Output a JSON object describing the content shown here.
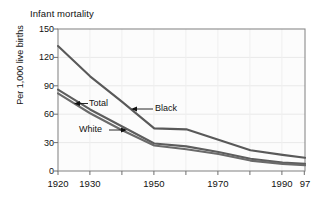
{
  "chart_data": {
    "type": "line",
    "title": "Infant mortality",
    "xlabel": "",
    "ylabel": "Per 1,000 live births",
    "xlim": [
      1920,
      1997
    ],
    "ylim": [
      0,
      150
    ],
    "grid": true,
    "legend_position": "inline-annotations",
    "yticks": [
      0,
      30,
      60,
      90,
      120,
      150
    ],
    "ytick_labels": [
      "0",
      "30",
      "60",
      "90",
      "120",
      "150"
    ],
    "xticks": [
      1920,
      1930,
      1940,
      1950,
      1960,
      1970,
      1980,
      1990,
      1997
    ],
    "xtick_labels_shown": [
      {
        "x": 1920,
        "label": "1920"
      },
      {
        "x": 1930,
        "label": "1930"
      },
      {
        "x": 1950,
        "label": "1950"
      },
      {
        "x": 1970,
        "label": "1970"
      },
      {
        "x": 1990,
        "label": "1990"
      },
      {
        "x": 1997,
        "label": "97"
      }
    ],
    "x": [
      1920,
      1930,
      1940,
      1950,
      1960,
      1970,
      1980,
      1990,
      1997
    ],
    "series": [
      {
        "name": "Black",
        "color": "#595959",
        "values": [
          132,
          100,
          73,
          45,
          44,
          33,
          22,
          17,
          14
        ]
      },
      {
        "name": "Total",
        "color": "#5d5d5d",
        "values": [
          86,
          65,
          47,
          29,
          26,
          20,
          13,
          9,
          7.5
        ]
      },
      {
        "name": "White",
        "color": "#6a6a6a",
        "values": [
          82,
          61,
          43,
          27,
          23,
          18,
          11,
          7.5,
          6
        ]
      }
    ],
    "annotations": [
      {
        "name": "total",
        "text": "Total",
        "arrow": "left",
        "x": 1933,
        "y": 72
      },
      {
        "name": "black",
        "text": "Black",
        "arrow": "left",
        "x": 1952,
        "y": 66
      },
      {
        "name": "white",
        "text": "White",
        "arrow": "right",
        "x": 1935,
        "y": 42
      }
    ]
  },
  "axis": {
    "ylabel": "Per 1,000 live births",
    "ytick_labels": [
      "150",
      "120",
      "90",
      "60",
      "30",
      "0"
    ],
    "xtick_labels": [
      "1920",
      "1930",
      "1950",
      "1970",
      "1990",
      "97"
    ]
  },
  "header": {
    "title": "Infant mortality"
  },
  "annotations": {
    "total": "Total",
    "black": "Black",
    "white": "White",
    "arrow_left": "←",
    "arrow_right": "→"
  },
  "colors": {
    "line": "#5d5d5d",
    "grid": "#e9e9e9",
    "frame": "#8a8a8a",
    "plot_bg": "#fcfcfc",
    "page_bg": "#ffffff",
    "text": "#111111"
  }
}
